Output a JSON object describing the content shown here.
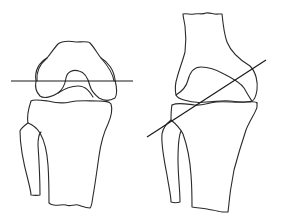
{
  "figure": {
    "stroke_color": "#2a2a2a",
    "background": "#ffffff",
    "panels": [
      {
        "id": "frontal-view",
        "elements": [
          "femur",
          "patella-notch",
          "tibia",
          "fibula",
          "horizontal-reference-line"
        ]
      },
      {
        "id": "lateral-view",
        "elements": [
          "femur",
          "femoral-condyle",
          "tibia",
          "fibula",
          "oblique-reference-line"
        ]
      }
    ]
  }
}
